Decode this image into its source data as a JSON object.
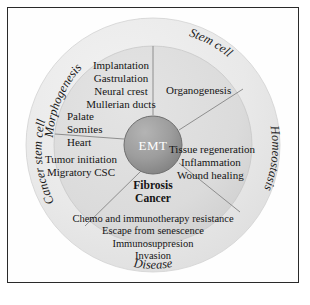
{
  "figure": {
    "type": "concentric-wheel-diagram",
    "center": {
      "label": "EMT",
      "color": "#9a9a9a",
      "text_color": "#ffffff"
    },
    "rings": {
      "outer_color": "#e8e8e8",
      "inner_color": "#dcdcdc"
    },
    "outer_labels": [
      {
        "name": "morphogenesis",
        "text": "Morphogenesis"
      },
      {
        "name": "stem-cell",
        "text": "Stem cell"
      },
      {
        "name": "homeostasis",
        "text": "Homeostasis"
      },
      {
        "name": "disease",
        "text": "Disease"
      },
      {
        "name": "cancer-stem-cell",
        "text": "Cancer stem cell"
      }
    ],
    "sectors": {
      "morphogenesis": {
        "items": [
          "Implantation",
          "Gastrulation",
          "Neural crest",
          "Mullerian ducts",
          "Palate",
          "Somites",
          "Heart"
        ]
      },
      "stem_cell": {
        "items": [
          "Organogenesis"
        ]
      },
      "homeostasis": {
        "items": [
          "Tissue regeneration",
          "Inflammation",
          "Wound healing"
        ]
      },
      "disease": {
        "headings": [
          "Fibrosis",
          "Cancer"
        ],
        "items": [
          "Chemo and immunotherapy resistance",
          "Escape from senescence",
          "Immunosuppresion",
          "Invasion"
        ]
      },
      "cancer_stem_cell": {
        "items": [
          "Tumor initiation",
          "Migratory CSC"
        ]
      }
    }
  }
}
